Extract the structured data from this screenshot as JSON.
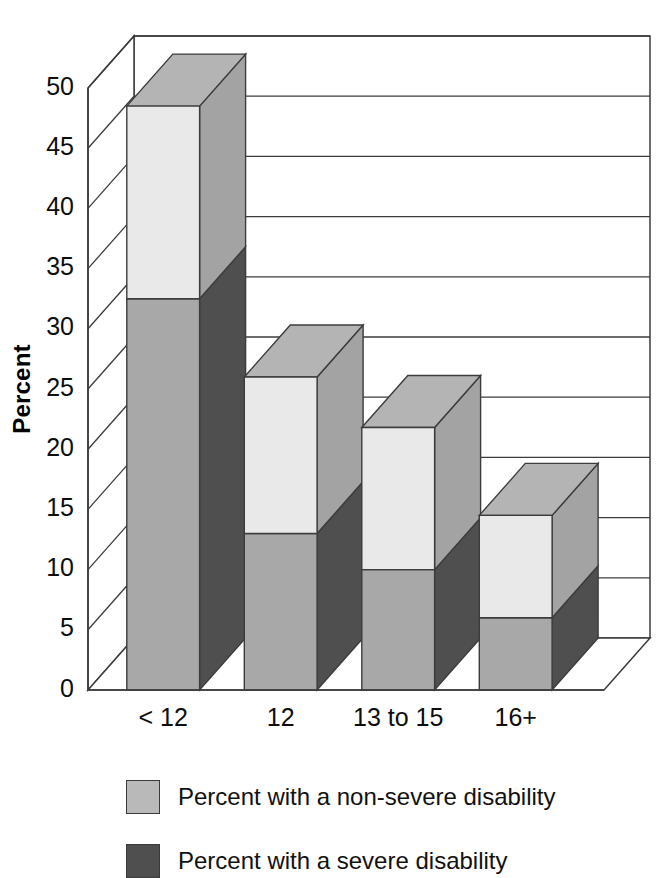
{
  "chart_data": {
    "type": "bar",
    "subtype": "stacked-3d-column",
    "title": "",
    "xlabel": "Years of School Completed",
    "ylabel": "Percent",
    "categories": [
      "< 12",
      "12",
      "13 to 15",
      "16+"
    ],
    "ylim": [
      0,
      50
    ],
    "ytick_step": 5,
    "yticks": [
      0,
      5,
      10,
      15,
      20,
      25,
      30,
      35,
      40,
      45,
      50
    ],
    "ytick_labels": [
      "0",
      "5",
      "10",
      "15",
      "20",
      "25",
      "30",
      "35",
      "40",
      "45",
      "50"
    ],
    "grid": true,
    "grid_axis": "y",
    "legend_position": "bottom-left",
    "series": [
      {
        "name": "Percent with a non-severe disability",
        "color": "#e9e9e9",
        "side_color": "#a3a3a3",
        "top_color": "#b4b4b4",
        "stack_order": "top",
        "values": [
          16.0,
          13.0,
          11.8,
          8.5
        ]
      },
      {
        "name": "Percent with a severe disability",
        "color": "#a8a8a8",
        "side_color": "#4f4f4f",
        "top_color": "#6e6e6e",
        "stack_order": "bottom",
        "values": [
          32.5,
          13.0,
          10.0,
          6.0
        ]
      }
    ],
    "totals": [
      48.5,
      26.0,
      21.8,
      14.5
    ]
  },
  "axis": {
    "y_title": "Percent",
    "x_title": "Years of School Completed"
  },
  "legend": {
    "items": [
      {
        "label": "Percent with a non-severe disability",
        "color": "#b9b9b9"
      },
      {
        "label": "Percent with a severe disability",
        "color": "#4f4f4f"
      }
    ]
  },
  "colors": {
    "outline": "#3c3c3c",
    "wall": "#ffffff",
    "floor": "#ffffff",
    "text": "#111111"
  }
}
